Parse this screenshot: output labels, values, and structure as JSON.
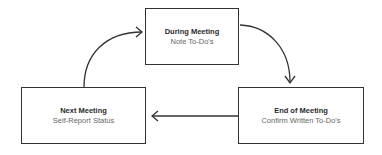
{
  "diagram": {
    "type": "cycle",
    "nodes": [
      {
        "id": "during",
        "title": "During Meeting",
        "subtitle": "Note To-Do's"
      },
      {
        "id": "end",
        "title": "End of Meeting",
        "subtitle": "Confirm Written To-Do's"
      },
      {
        "id": "next",
        "title": "Next Meeting",
        "subtitle": "Self-Report Status"
      }
    ],
    "edges": [
      {
        "from": "during",
        "to": "end"
      },
      {
        "from": "end",
        "to": "next"
      },
      {
        "from": "next",
        "to": "during"
      }
    ],
    "colors": {
      "border": "#333333",
      "title": "#2a2a2a",
      "subtitle": "#666666",
      "arrow": "#333333"
    }
  }
}
